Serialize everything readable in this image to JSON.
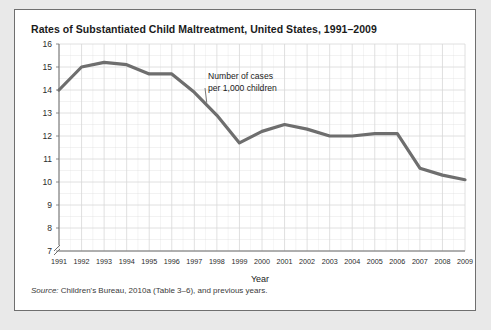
{
  "figure": {
    "title": "Rates of Substantiated Child Maltreatment, United States, 1991–2009",
    "source_label": "Source:",
    "source_text": "Children's Bureau, 2010a (Table 3–6), and previous years."
  },
  "chart_data": {
    "type": "line",
    "title": "Rates of Substantiated Child Maltreatment, United States, 1991–2009",
    "xlabel": "Year",
    "ylabel": "",
    "annotation": "Number of cases per 1,000 children",
    "annotation_line1": "Number of cases",
    "annotation_line2": "per 1,000 children",
    "categories": [
      1991,
      1992,
      1993,
      1994,
      1995,
      1996,
      1997,
      1998,
      1999,
      2000,
      2001,
      2002,
      2003,
      2004,
      2005,
      2006,
      2007,
      2008,
      2009
    ],
    "x_tick_labels": [
      "1991",
      "1992",
      "1993",
      "1994",
      "1995",
      "1996",
      "1997",
      "1998",
      "1999",
      "2000",
      "2001",
      "2002",
      "2003",
      "2004",
      "2005",
      "2006",
      "2007",
      "2008",
      "2009"
    ],
    "y_tick_labels": [
      "16",
      "15",
      "14",
      "13",
      "12",
      "11",
      "10",
      "9",
      "8",
      "7"
    ],
    "values": [
      14.0,
      15.0,
      15.2,
      15.1,
      14.7,
      14.7,
      13.9,
      12.9,
      11.7,
      12.2,
      12.5,
      12.3,
      12.0,
      12.0,
      12.1,
      12.1,
      10.6,
      10.3,
      10.1
    ],
    "ylim": [
      7,
      16
    ],
    "xlim": [
      1991,
      2009
    ],
    "grid": true,
    "legend": "none",
    "axis_break": true,
    "series_color": "#6e6e6e"
  },
  "colors": {
    "line": "#6e6e6e",
    "grid": "#d8d8d8",
    "axis": "#6f6f6f",
    "card_border": "#6f6f6f",
    "page_background": "#e9e9e9"
  }
}
